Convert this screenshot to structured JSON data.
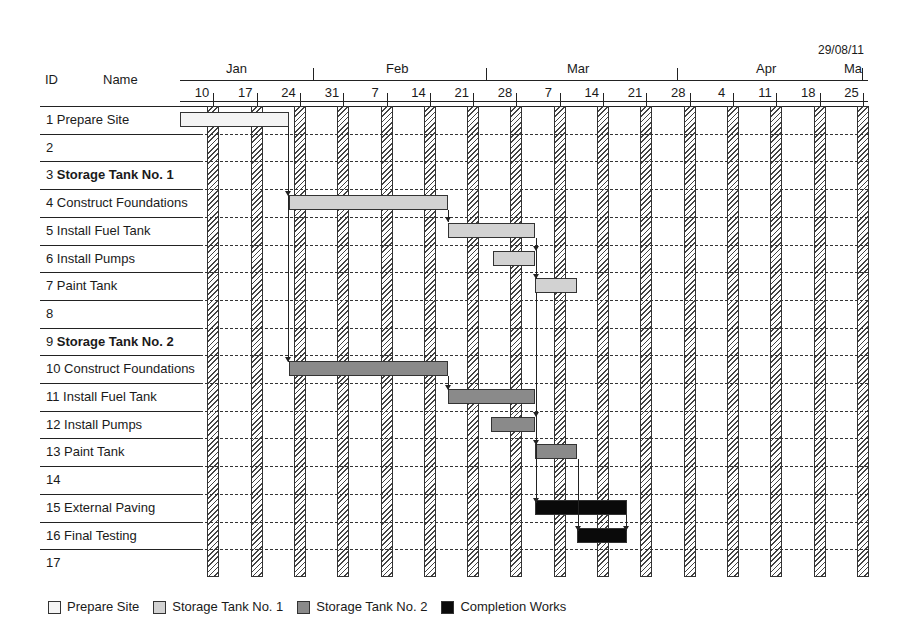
{
  "chart_data": {
    "type": "gantt",
    "title": "",
    "date_stamp": "29/08/11",
    "header": {
      "id_label": "ID",
      "name_label": "Name"
    },
    "months": [
      {
        "label": "Jan",
        "x": 240
      },
      {
        "label": "Feb",
        "x": 400
      },
      {
        "label": "Mar",
        "x": 581
      },
      {
        "label": "Apr",
        "x": 770
      },
      {
        "label": "Ma",
        "x": 858
      }
    ],
    "weeks": [
      "10",
      "17",
      "24",
      "31",
      "7",
      "14",
      "21",
      "28",
      "7",
      "14",
      "21",
      "28",
      "4",
      "11",
      "18",
      "25"
    ],
    "rows": [
      {
        "id": "1",
        "name": "Prepare Site",
        "bold": false
      },
      {
        "id": "2",
        "name": "",
        "bold": false
      },
      {
        "id": "3",
        "name": "Storage Tank No. 1",
        "bold": true
      },
      {
        "id": "4",
        "name": "Construct Foundations",
        "bold": false
      },
      {
        "id": "5",
        "name": "Install Fuel Tank",
        "bold": false
      },
      {
        "id": "6",
        "name": "Install Pumps",
        "bold": false
      },
      {
        "id": "7",
        "name": "Paint Tank",
        "bold": false
      },
      {
        "id": "8",
        "name": "",
        "bold": false
      },
      {
        "id": "9",
        "name": "Storage Tank No. 2",
        "bold": true
      },
      {
        "id": "10",
        "name": "Construct Foundations",
        "bold": false
      },
      {
        "id": "11",
        "name": "Install Fuel Tank",
        "bold": false
      },
      {
        "id": "12",
        "name": "Install Pumps",
        "bold": false
      },
      {
        "id": "13",
        "name": "Paint Tank",
        "bold": false
      },
      {
        "id": "14",
        "name": "",
        "bold": false
      },
      {
        "id": "15",
        "name": "External Paving",
        "bold": false
      },
      {
        "id": "16",
        "name": "Final Testing",
        "bold": false
      },
      {
        "id": "17",
        "name": "",
        "bold": false
      }
    ],
    "tasks": [
      {
        "row": 1,
        "group": "Prepare Site",
        "start": "Jan 5",
        "end": "Jan 22"
      },
      {
        "row": 4,
        "group": "Storage Tank No. 1",
        "start": "Jan 23",
        "end": "Feb 17"
      },
      {
        "row": 5,
        "group": "Storage Tank No. 1",
        "start": "Feb 17",
        "end": "Mar 3"
      },
      {
        "row": 6,
        "group": "Storage Tank No. 1",
        "start": "Feb 24",
        "end": "Mar 3"
      },
      {
        "row": 7,
        "group": "Storage Tank No. 1",
        "start": "Mar 3",
        "end": "Mar 10"
      },
      {
        "row": 10,
        "group": "Storage Tank No. 2",
        "start": "Jan 23",
        "end": "Feb 17"
      },
      {
        "row": 11,
        "group": "Storage Tank No. 2",
        "start": "Feb 17",
        "end": "Mar 3"
      },
      {
        "row": 12,
        "group": "Storage Tank No. 2",
        "start": "Feb 24",
        "end": "Mar 3"
      },
      {
        "row": 13,
        "group": "Storage Tank No. 2",
        "start": "Mar 3",
        "end": "Mar 10"
      },
      {
        "row": 15,
        "group": "Completion Works",
        "start": "Mar 3",
        "end": "Mar 18"
      },
      {
        "row": 16,
        "group": "Completion Works",
        "start": "Mar 10",
        "end": "Mar 18"
      }
    ],
    "legend": [
      {
        "label": "Prepare Site",
        "color": "#f4f4f4"
      },
      {
        "label": "Storage Tank No. 1",
        "color": "#d2d2d2"
      },
      {
        "label": "Storage Tank No. 2",
        "color": "#8a8a8a"
      },
      {
        "label": "Completion Works",
        "color": "#0a0a0a"
      }
    ],
    "weekend_shading": "hatched vertical bands each week",
    "grid": true
  }
}
